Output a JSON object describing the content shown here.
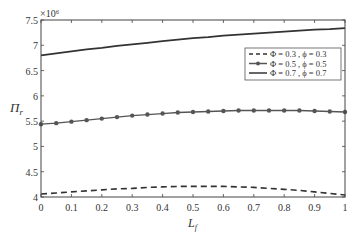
{
  "chart_data": {
    "type": "line",
    "title": "",
    "xlabel": "L_f",
    "ylabel": "Π_r",
    "y_multiplier": "×10⁶",
    "xlim": [
      0,
      1
    ],
    "ylim": [
      4,
      7.5
    ],
    "x_ticks": [
      "0",
      "0.1",
      "0.2",
      "0.3",
      "0.4",
      "0.5",
      "0.6",
      "0.7",
      "0.8",
      "0.9",
      "1"
    ],
    "y_ticks": [
      "4",
      "4.5",
      "5",
      "5.5",
      "6",
      "6.5",
      "7",
      "7.5"
    ],
    "grid": false,
    "legend_position": "upper right (below top curve)",
    "x": [
      0,
      0.05,
      0.1,
      0.15,
      0.2,
      0.25,
      0.3,
      0.35,
      0.4,
      0.45,
      0.5,
      0.55,
      0.6,
      0.65,
      0.7,
      0.75,
      0.8,
      0.85,
      0.9,
      0.95,
      1.0
    ],
    "series": [
      {
        "name": "Φ = 0.3 , ϕ = 0.3",
        "style": "dashed",
        "values": [
          4.06,
          4.08,
          4.1,
          4.12,
          4.14,
          4.16,
          4.17,
          4.19,
          4.2,
          4.21,
          4.21,
          4.21,
          4.21,
          4.2,
          4.19,
          4.17,
          4.15,
          4.13,
          4.1,
          4.07,
          4.04
        ]
      },
      {
        "name": "Φ = 0.5 , ϕ = 0.5",
        "style": "solid-with-markers",
        "values": [
          5.44,
          5.46,
          5.49,
          5.52,
          5.55,
          5.58,
          5.61,
          5.63,
          5.65,
          5.67,
          5.68,
          5.69,
          5.7,
          5.71,
          5.71,
          5.71,
          5.71,
          5.71,
          5.7,
          5.69,
          5.68
        ]
      },
      {
        "name": "Φ = 0.7 , ϕ = 0.7",
        "style": "solid",
        "values": [
          6.8,
          6.84,
          6.88,
          6.92,
          6.95,
          6.99,
          7.02,
          7.05,
          7.08,
          7.11,
          7.14,
          7.16,
          7.19,
          7.21,
          7.23,
          7.25,
          7.27,
          7.29,
          7.31,
          7.32,
          7.34
        ]
      }
    ]
  }
}
